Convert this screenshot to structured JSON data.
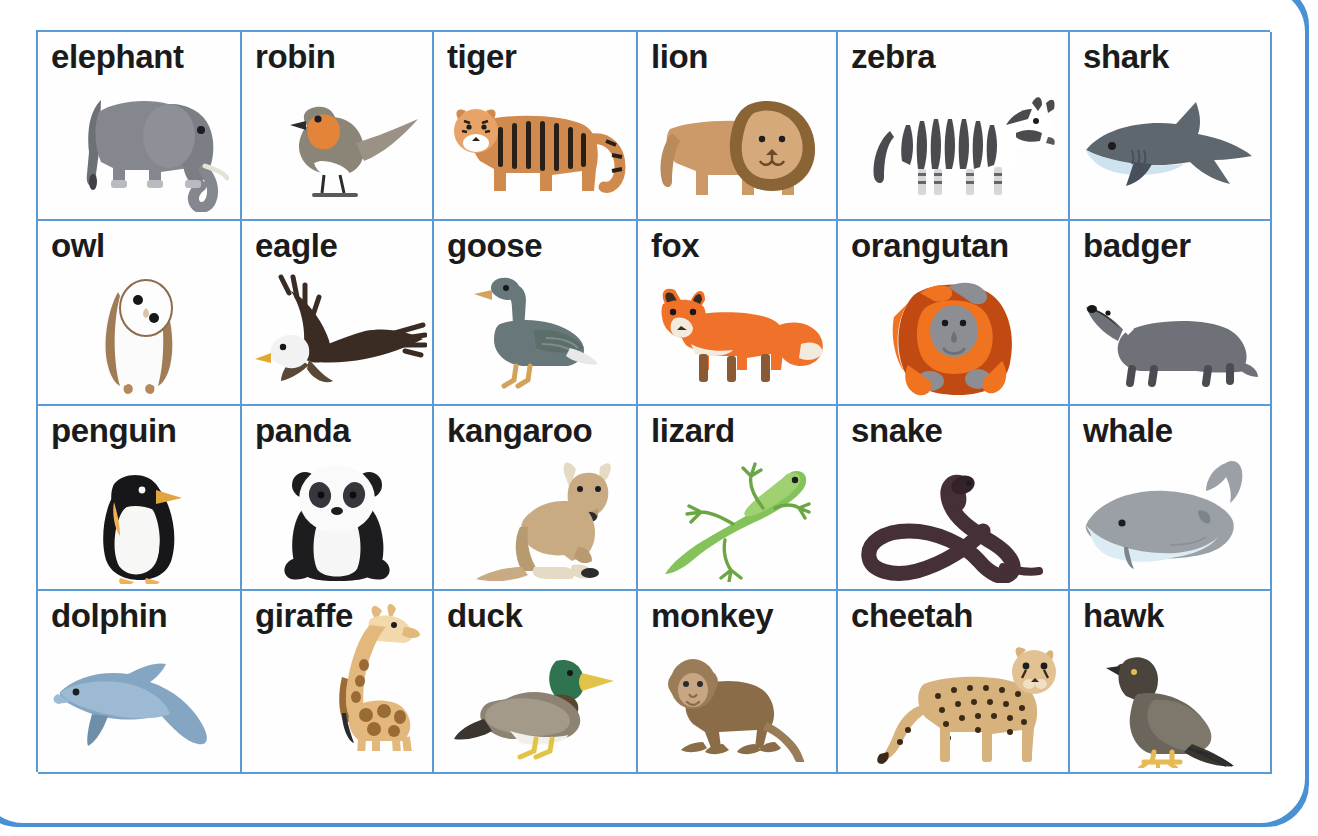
{
  "page": {
    "kind": "animal-vocabulary-flashcard-grid",
    "frame_color": "#4a90d4",
    "grid_line_color": "#5b9bd5",
    "label_color": "#1b1b1b",
    "background": "#ffffff",
    "columns": 6,
    "rows": 4
  },
  "cards": [
    {
      "label": "elephant",
      "icon": "elephant-illustration",
      "colors": [
        "#7f8189",
        "#9a9ca3",
        "#6e7077"
      ]
    },
    {
      "label": "robin",
      "icon": "robin-illustration",
      "colors": [
        "#8b8578",
        "#e2853a",
        "#ffffff"
      ]
    },
    {
      "label": "tiger",
      "icon": "tiger-illustration",
      "colors": [
        "#d08a4e",
        "#2a1f17",
        "#ffffff"
      ]
    },
    {
      "label": "lion",
      "icon": "lion-illustration",
      "colors": [
        "#cb9a68",
        "#8b6436",
        "#e0bb8d"
      ]
    },
    {
      "label": "zebra",
      "icon": "zebra-illustration",
      "colors": [
        "#ffffff",
        "#4b4b4f",
        "#d7d7d7"
      ]
    },
    {
      "label": "shark",
      "icon": "shark-illustration",
      "colors": [
        "#5e666e",
        "#cfe2ef",
        "#48505a"
      ]
    },
    {
      "label": "owl",
      "icon": "owl-illustration",
      "colors": [
        "#ffffff",
        "#a07c56",
        "#e8ded0"
      ]
    },
    {
      "label": "eagle",
      "icon": "eagle-illustration",
      "colors": [
        "#3a2c22",
        "#ffffff",
        "#e3a92c"
      ]
    },
    {
      "label": "goose",
      "icon": "goose-illustration",
      "colors": [
        "#68787a",
        "#5c6e6a",
        "#d3a35c"
      ]
    },
    {
      "label": "fox",
      "icon": "fox-illustration",
      "colors": [
        "#f0712a",
        "#f2ebdd",
        "#8a5a34"
      ]
    },
    {
      "label": "orangutan",
      "icon": "orangutan-illustration",
      "colors": [
        "#f0731f",
        "#c14a12",
        "#8d8e93"
      ]
    },
    {
      "label": "badger",
      "icon": "badger-illustration",
      "colors": [
        "#6e7278",
        "#ffffff",
        "#2f3136"
      ]
    },
    {
      "label": "penguin",
      "icon": "penguin-illustration",
      "colors": [
        "#17171a",
        "#ffffff",
        "#f0b056"
      ]
    },
    {
      "label": "panda",
      "icon": "panda-illustration",
      "colors": [
        "#1d1d20",
        "#fafafa",
        "#5a5a61"
      ]
    },
    {
      "label": "kangaroo",
      "icon": "kangaroo-illustration",
      "colors": [
        "#c8ab83",
        "#b89a71",
        "#e5dac4"
      ]
    },
    {
      "label": "lizard",
      "icon": "lizard-illustration",
      "colors": [
        "#84c35a",
        "#9fd173",
        "#6ba644"
      ]
    },
    {
      "label": "snake",
      "icon": "snake-illustration",
      "colors": [
        "#463037",
        "#33222a",
        "#5a4049"
      ]
    },
    {
      "label": "whale",
      "icon": "whale-illustration",
      "colors": [
        "#9aa0a6",
        "#dcecf5",
        "#7d858c"
      ]
    },
    {
      "label": "dolphin",
      "icon": "dolphin-illustration",
      "colors": [
        "#85a6c2",
        "#9cbad3",
        "#6f8fa9"
      ]
    },
    {
      "label": "giraffe",
      "icon": "giraffe-illustration",
      "colors": [
        "#e2b87c",
        "#9a6b35",
        "#f2d8ab"
      ]
    },
    {
      "label": "duck",
      "icon": "duck-illustration",
      "colors": [
        "#2f7350",
        "#8c8375",
        "#e2c34a"
      ]
    },
    {
      "label": "monkey",
      "icon": "monkey-illustration",
      "colors": [
        "#9a7c58",
        "#8a6c48",
        "#c9a683"
      ]
    },
    {
      "label": "cheetah",
      "icon": "cheetah-illustration",
      "colors": [
        "#d7b27c",
        "#3c2a18",
        "#efe0c4"
      ]
    },
    {
      "label": "hawk",
      "icon": "hawk-illustration",
      "colors": [
        "#6b655c",
        "#4a443c",
        "#e6bb55"
      ]
    }
  ]
}
